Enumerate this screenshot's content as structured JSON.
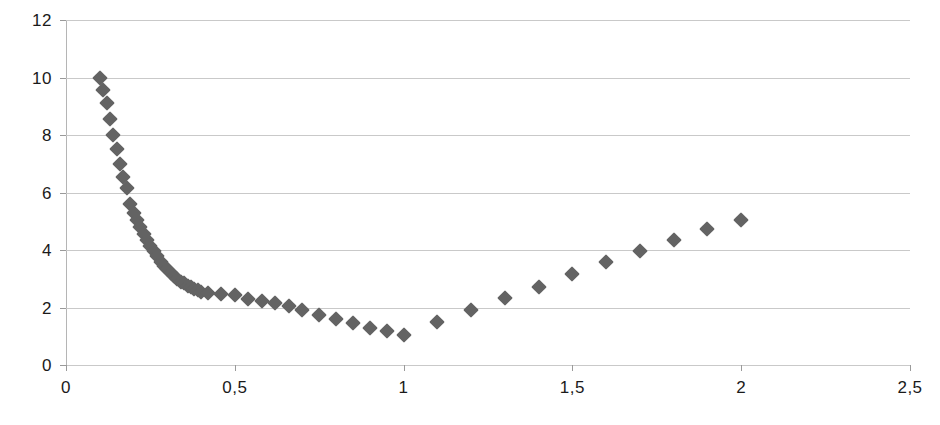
{
  "chart_data": {
    "type": "scatter",
    "title": "",
    "subtitle": "",
    "xlabel": "",
    "ylabel": "",
    "xlim": [
      0,
      2.5
    ],
    "ylim": [
      0,
      12
    ],
    "grid": true,
    "legend": false,
    "legend_position": "none",
    "marker": "diamond",
    "marker_color": "#636363",
    "gridline_color": "#c9c9c9",
    "axis_color": "#b5b5b5",
    "background_color": "#ffffff",
    "decimal_separator": ",",
    "x_ticks": [
      0,
      0.5,
      1,
      1.5,
      2,
      2.5
    ],
    "x_tick_labels": [
      "0",
      "0,5",
      "1",
      "1,5",
      "2",
      "2,5"
    ],
    "y_ticks": [
      0,
      2,
      4,
      6,
      8,
      10,
      12
    ],
    "y_tick_labels": [
      "0",
      "2",
      "4",
      "6",
      "8",
      "10",
      "12"
    ],
    "series": [
      {
        "name": "series-1",
        "x": [
          0.1,
          0.11,
          0.12,
          0.13,
          0.14,
          0.15,
          0.16,
          0.17,
          0.18,
          0.19,
          0.2,
          0.21,
          0.22,
          0.23,
          0.24,
          0.25,
          0.26,
          0.27,
          0.28,
          0.29,
          0.3,
          0.31,
          0.32,
          0.33,
          0.34,
          0.35,
          0.36,
          0.37,
          0.38,
          0.39,
          0.4,
          0.42,
          0.46,
          0.5,
          0.54,
          0.58,
          0.62,
          0.66,
          0.7,
          0.75,
          0.8,
          0.85,
          0.9,
          0.95,
          1.0,
          1.1,
          1.2,
          1.3,
          1.4,
          1.5,
          1.6,
          1.7,
          1.8,
          1.9,
          2.0
        ],
        "y": [
          10.0,
          9.55,
          9.1,
          8.55,
          8.0,
          7.5,
          7.0,
          6.55,
          6.15,
          5.6,
          5.3,
          5.05,
          4.8,
          4.55,
          4.35,
          4.15,
          3.95,
          3.8,
          3.6,
          3.45,
          3.35,
          3.2,
          3.1,
          3.0,
          2.9,
          2.85,
          2.75,
          2.7,
          2.65,
          2.6,
          2.55,
          2.52,
          2.48,
          2.42,
          2.3,
          2.22,
          2.15,
          2.05,
          1.92,
          1.75,
          1.6,
          1.45,
          1.3,
          1.18,
          1.05,
          1.5,
          1.92,
          2.32,
          2.72,
          3.18,
          3.58,
          3.98,
          4.35,
          4.72,
          5.05
        ]
      }
    ]
  }
}
